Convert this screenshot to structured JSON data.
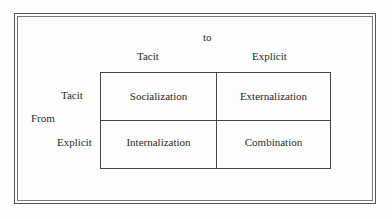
{
  "diagram": {
    "top_axis_label": "to",
    "side_axis_label": "From",
    "columns": [
      "Tacit",
      "Explicit"
    ],
    "rows": [
      "Tacit",
      "Explicit"
    ],
    "cells": [
      [
        "Socialization",
        "Externalization"
      ],
      [
        "Internalization",
        "Combination"
      ]
    ]
  }
}
